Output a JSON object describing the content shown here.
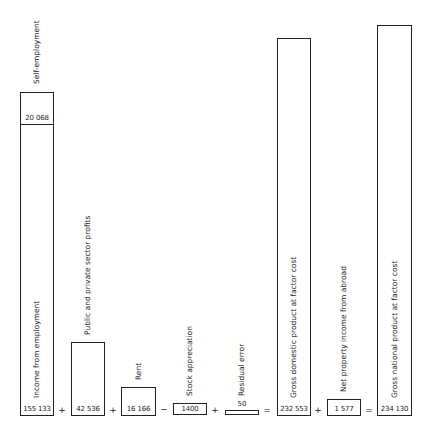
{
  "bars": [
    {
      "label": "Income from employment",
      "value": "155 133",
      "sub_label": "Self-employment",
      "sub_value": "20 068"
    },
    {
      "label": "Public and private sector profits",
      "value": "42 536"
    },
    {
      "label": "Rent",
      "value": "16 166"
    },
    {
      "label": "Stock appreciation",
      "value": "1400"
    },
    {
      "label": "Residual error",
      "value": "50"
    },
    {
      "label": "Gross domestic product at factor cost",
      "value": "232 553"
    },
    {
      "label": "Net property income from abroad",
      "value": "1 577"
    },
    {
      "label": "Gross national product at factor cost",
      "value": "234 130"
    }
  ],
  "operators": [
    "+",
    "+",
    "−",
    "+",
    "=",
    "+",
    "="
  ]
}
